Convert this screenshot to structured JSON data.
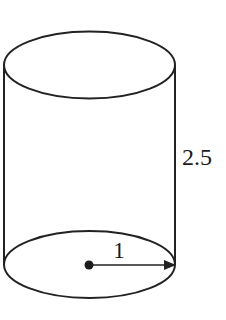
{
  "diagram": {
    "type": "cylinder",
    "stroke_color": "#222222",
    "background": "#ffffff",
    "labels": {
      "height": "2.5",
      "radius": "1"
    },
    "geometry": {
      "top_ellipse": {
        "cx": 89.5,
        "cy": 65,
        "rx": 85.5,
        "ry": 33.5
      },
      "bottom_ellipse": {
        "cx": 89.5,
        "cy": 264.5,
        "rx": 85.5,
        "ry": 33.5
      },
      "center_dot": {
        "cx": 89,
        "cy": 265
      },
      "radius_arrow": {
        "x1": 89,
        "y1": 265,
        "x2": 175,
        "y2": 265
      }
    }
  }
}
